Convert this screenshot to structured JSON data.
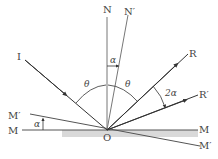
{
  "diagram": {
    "type": "optics-rotating-mirror-reflection",
    "labels": {
      "normal": "N",
      "normal_rotated": "N′",
      "incident": "I",
      "reflected": "R",
      "reflected_rotated": "R′",
      "mirror_left": "M",
      "mirror_right": "M",
      "mirror_rotated_left": "M′",
      "mirror_rotated_right": "M′",
      "origin": "O",
      "theta_left": "θ",
      "theta_right": "θ",
      "alpha_top": "α",
      "alpha_mirror": "α",
      "two_alpha": "2α"
    },
    "colors": {
      "ray": "#333333",
      "normal": "#777777",
      "mirror_shade": "#d9d9d9",
      "text": "#444444"
    }
  }
}
